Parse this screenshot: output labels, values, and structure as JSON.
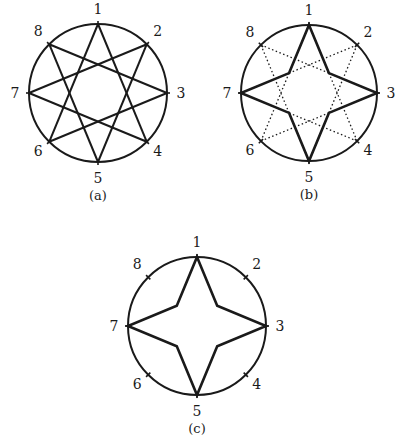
{
  "figure": {
    "panels": [
      {
        "id": "a",
        "caption": "(a)",
        "center": [
          98,
          93
        ],
        "radius": 69,
        "points": [
          "1",
          "2",
          "3",
          "4",
          "5",
          "6",
          "7",
          "8"
        ],
        "description": "Eight points on a circle joined as an {8/3} star polygon (all solid lines)"
      },
      {
        "id": "b",
        "caption": "(b)",
        "center": [
          309,
          93
        ],
        "radius": 68,
        "points": [
          "1",
          "2",
          "3",
          "4",
          "5",
          "6",
          "7",
          "8"
        ],
        "description": "{8/3} star with outer four-pointed star boundary through 1,3,5,7 drawn solid, remaining segments dotted"
      },
      {
        "id": "c",
        "caption": "(c)",
        "center": [
          197,
          326
        ],
        "radius": 69,
        "points": [
          "1",
          "2",
          "3",
          "4",
          "5",
          "6",
          "7",
          "8"
        ],
        "description": "Only the four-pointed star through 1,3,5,7 remains; points 2,4,6,8 marked by ticks"
      }
    ],
    "colors": {
      "stroke": "#1a1a1a",
      "background": "#ffffff"
    }
  }
}
